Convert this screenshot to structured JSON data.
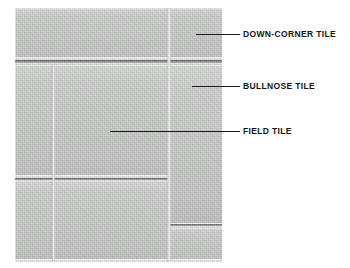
{
  "figure": {
    "background_color": "#ffffff",
    "tile_color": "#c9cbc9",
    "label_color": "#141414",
    "leader_color": "#1a1a1a"
  },
  "callouts": [
    {
      "id": "down-corner",
      "label": "DOWN-CORNER TILE",
      "leader": {
        "x": 196,
        "y": 34,
        "width": 44
      },
      "text_pos": {
        "x": 243,
        "y": 30
      }
    },
    {
      "id": "bullnose",
      "label": "BULLNOSE TILE",
      "leader": {
        "x": 192,
        "y": 86,
        "width": 48
      },
      "text_pos": {
        "x": 243,
        "y": 82
      }
    },
    {
      "id": "field",
      "label": "FIELD TILE",
      "leader": {
        "x": 110,
        "y": 131,
        "width": 130
      },
      "text_pos": {
        "x": 243,
        "y": 127
      }
    }
  ],
  "tiles": [
    {
      "id": "top-wide",
      "name": "top-wide-field-tile",
      "x": 0,
      "y": 0,
      "w": 153,
      "h": 52
    },
    {
      "id": "top-corner",
      "name": "down-corner-tile",
      "x": 155,
      "y": 0,
      "w": 52,
      "h": 52
    },
    {
      "id": "mid-left-narrow",
      "name": "left-narrow-field-tile",
      "x": 0,
      "y": 57,
      "w": 37,
      "h": 113
    },
    {
      "id": "mid-large-field",
      "name": "large-field-tile",
      "x": 39,
      "y": 57,
      "w": 114,
      "h": 113
    },
    {
      "id": "right-bullnose",
      "name": "bullnose-tile",
      "x": 155,
      "y": 57,
      "w": 52,
      "h": 161
    },
    {
      "id": "low-left-narrow",
      "name": "lower-left-field-tile",
      "x": 0,
      "y": 172,
      "w": 37,
      "h": 82
    },
    {
      "id": "low-large-field",
      "name": "lower-large-field-tile",
      "x": 39,
      "y": 172,
      "w": 114,
      "h": 82
    },
    {
      "id": "right-lower",
      "name": "lower-bullnose-tile",
      "x": 155,
      "y": 220,
      "w": 52,
      "h": 34
    }
  ],
  "grout_lines": [
    {
      "id": "h-top",
      "orientation": "horizontal",
      "x": 0,
      "y": 52,
      "length": 153,
      "thickness": 5
    },
    {
      "id": "h-top-r",
      "orientation": "horizontal",
      "x": 155,
      "y": 52,
      "length": 52,
      "thickness": 5
    },
    {
      "id": "h-mid",
      "orientation": "horizontal",
      "x": 0,
      "y": 170,
      "length": 153,
      "thickness": 4
    },
    {
      "id": "h-right",
      "orientation": "horizontal",
      "x": 155,
      "y": 216,
      "length": 52,
      "thickness": 4
    },
    {
      "id": "v-left",
      "orientation": "vertical",
      "x": 37,
      "y": 57,
      "length": 197,
      "thickness": 3
    },
    {
      "id": "v-right",
      "orientation": "vertical",
      "x": 152,
      "y": 0,
      "length": 254,
      "thickness": 4
    }
  ]
}
